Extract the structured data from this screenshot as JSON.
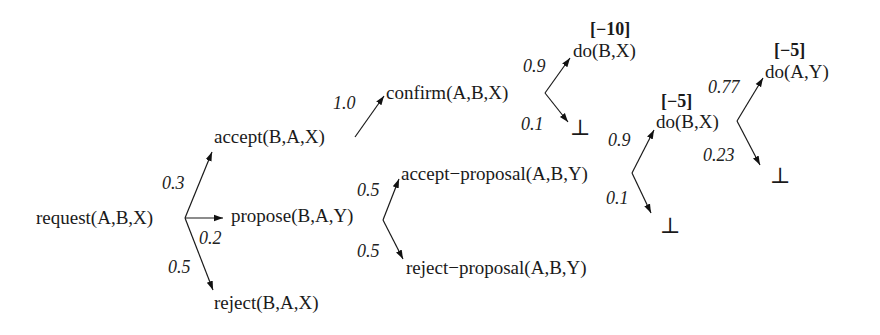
{
  "diagram": {
    "type": "probabilistic-interaction-tree",
    "nodes": {
      "request": "request(A,B,X)",
      "accept": "accept(B,A,X)",
      "propose": "propose(B,A,Y)",
      "reject": "reject(B,A,X)",
      "confirm": "confirm(A,B,X)",
      "do_bx_1": "do(B,X)",
      "bottom_1": "⊥",
      "accept_proposal": "accept−proposal(A,B,Y)",
      "reject_proposal": "reject−proposal(A,B,Y)",
      "do_bx_2": "do(B,X)",
      "bottom_2": "⊥",
      "do_ay": "do(A,Y)",
      "bottom_3": "⊥"
    },
    "rewards": {
      "do_bx_1": "[−10]",
      "do_bx_2": "[−5]",
      "do_ay": "[−5]"
    },
    "edges": [
      {
        "from": "request",
        "to": "accept",
        "prob": "0.3"
      },
      {
        "from": "request",
        "to": "propose",
        "prob": "0.2"
      },
      {
        "from": "request",
        "to": "reject",
        "prob": "0.5"
      },
      {
        "from": "accept",
        "to": "confirm",
        "prob": "1.0"
      },
      {
        "from": "confirm",
        "to": "do_bx_1",
        "prob": "0.9"
      },
      {
        "from": "confirm",
        "to": "bottom_1",
        "prob": "0.1"
      },
      {
        "from": "propose",
        "to": "accept_proposal",
        "prob": "0.5"
      },
      {
        "from": "propose",
        "to": "reject_proposal",
        "prob": "0.5"
      },
      {
        "from": "accept_proposal",
        "to": "do_bx_2",
        "prob": "0.9"
      },
      {
        "from": "accept_proposal",
        "to": "bottom_2",
        "prob": "0.1"
      },
      {
        "from": "do_bx_2",
        "to": "do_ay",
        "prob": "0.77"
      },
      {
        "from": "do_bx_2",
        "to": "bottom_3",
        "prob": "0.23"
      }
    ]
  }
}
